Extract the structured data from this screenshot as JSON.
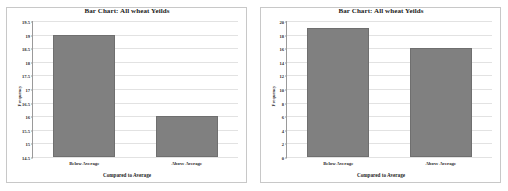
{
  "chart_data": [
    {
      "type": "bar",
      "title": "Bar Chart: All wheat Yeilds",
      "xlabel": "Compared to Average",
      "ylabel": "Frequency",
      "categories": [
        "Below Average",
        "Above Average"
      ],
      "values": [
        19,
        16
      ],
      "ylim": [
        14.5,
        19.5
      ],
      "yticks": [
        14.5,
        15,
        15.5,
        16,
        16.5,
        17,
        17.5,
        18,
        18.5,
        19,
        19.5
      ],
      "ytick_labels": [
        "14.5",
        "15",
        "15.5",
        "16",
        "16.5",
        "17",
        "17.5",
        "18",
        "18.5",
        "19",
        "19.5"
      ],
      "grid": true,
      "legend": "none",
      "bar_color": "#808080"
    },
    {
      "type": "bar",
      "title": "Bar Chart: All wheat Yeilds",
      "xlabel": "Compared to Average",
      "ylabel": "Frequency",
      "categories": [
        "Below Average",
        "Above Average"
      ],
      "values": [
        19,
        16
      ],
      "ylim": [
        0,
        20
      ],
      "yticks": [
        0,
        2,
        4,
        6,
        8,
        10,
        12,
        14,
        16,
        18,
        20
      ],
      "ytick_labels": [
        "0",
        "2",
        "4",
        "6",
        "8",
        "10",
        "12",
        "14",
        "16",
        "18",
        "20"
      ],
      "grid": true,
      "legend": "none",
      "bar_color": "#808080"
    }
  ]
}
